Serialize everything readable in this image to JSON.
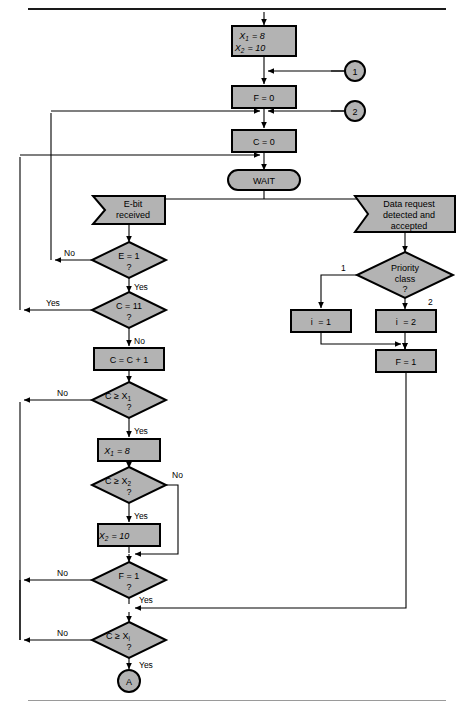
{
  "figure": {
    "type": "flowchart",
    "title": "",
    "palette": {
      "shape_fill": "#b3b3b3",
      "shape_stroke": "#000000",
      "line": "#000000",
      "background": "#ffffff",
      "rule_top": "#1a1a1a",
      "rule_bottom": "#9a9a9a"
    }
  },
  "nodes": {
    "init": {
      "shape": "process",
      "line1": "X",
      "sub1": "1",
      "eq1": "= 8",
      "line2": "X",
      "sub2": "2",
      "eq2": "= 10",
      "text": "X1 = 8 / X2 = 10"
    },
    "f_zero": {
      "shape": "process",
      "text": "F = 0"
    },
    "c_zero": {
      "shape": "process",
      "text": "C = 0"
    },
    "wait": {
      "shape": "terminator",
      "text": "WAIT"
    },
    "ebit": {
      "shape": "flag",
      "line1": "E-bit",
      "line2": "received",
      "text": "E-bit received"
    },
    "data_request": {
      "shape": "flag",
      "line1": "Data request",
      "line2": "detected and",
      "line3": "accepted",
      "text": "Data request detected and accepted"
    },
    "e_eq_1": {
      "shape": "decision",
      "line1": "E = 1",
      "line2": "?",
      "text": "E = 1 ?"
    },
    "c_eq_11": {
      "shape": "decision",
      "line1": "C = 11",
      "line2": "?",
      "text": "C = 11 ?"
    },
    "c_inc": {
      "shape": "process",
      "text": "C = C + 1"
    },
    "c_ge_x1": {
      "shape": "decision",
      "line1": "C ≥ X",
      "sub1": "1",
      "line2": "?",
      "text": "C ≥ X1 ?"
    },
    "x1_set": {
      "shape": "process",
      "line1": "X",
      "sub1": "1",
      "eq1": "= 8",
      "text": "X1 = 8"
    },
    "c_ge_x2": {
      "shape": "decision",
      "line1": "C ≥ X",
      "sub1": "2",
      "line2": "?",
      "text": "C ≥ X2 ?"
    },
    "x2_set": {
      "shape": "process",
      "line1": "X",
      "sub1": "2",
      "eq1": "= 10",
      "text": "X2 = 10"
    },
    "f_eq_1": {
      "shape": "decision",
      "line1": "F = 1",
      "line2": "?",
      "text": "F = 1 ?"
    },
    "c_ge_xi": {
      "shape": "decision",
      "line1": "C ≥ X",
      "sub1": "i",
      "line2": "?",
      "text": "C ≥ Xi ?"
    },
    "priority": {
      "shape": "decision",
      "line1": "Priority",
      "line2": "class",
      "line3": "?",
      "text": "Priority class ?"
    },
    "i_eq_1": {
      "shape": "process",
      "line1": "i",
      "eq1": "= 1",
      "text": "i = 1"
    },
    "i_eq_2": {
      "shape": "process",
      "line1": "i",
      "eq1": "= 2",
      "text": "i = 2"
    },
    "f_set_1": {
      "shape": "process",
      "text": "F = 1"
    },
    "conn_1": {
      "shape": "connector",
      "text": "1"
    },
    "conn_2": {
      "shape": "connector",
      "text": "2"
    },
    "conn_a": {
      "shape": "connector",
      "text": "A"
    }
  },
  "edge_labels": {
    "e_no": "No",
    "e_yes": "Yes",
    "c11_yes": "Yes",
    "c11_no": "No",
    "cx1_no": "No",
    "cx1_yes": "Yes",
    "cx2_no": "No",
    "cx2_yes": "Yes",
    "f_no": "No",
    "f_yes": "Yes",
    "cxi_no": "No",
    "cxi_yes": "Yes",
    "prio_1": "1",
    "prio_2": "2"
  }
}
